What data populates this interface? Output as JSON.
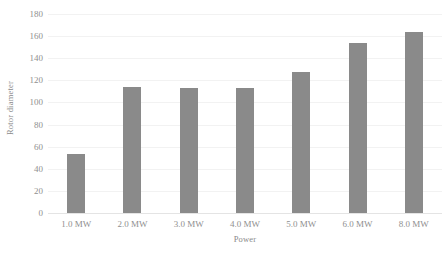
{
  "chart_data": {
    "type": "bar",
    "title": "",
    "xlabel": "Power",
    "ylabel": "Rotor diameter",
    "categories": [
      "1.0 MW",
      "2.0 MW",
      "3.0 MW",
      "4.0 MW",
      "5.0 MW",
      "6.0 MW",
      "8.0 MW"
    ],
    "values": [
      53,
      114,
      113,
      113,
      128,
      154,
      164
    ],
    "series": [
      {
        "name": "Rotor diameter",
        "values": [
          53,
          114,
          113,
          113,
          128,
          154,
          164
        ]
      }
    ],
    "ylim": [
      0,
      180
    ],
    "yticks": [
      0,
      20,
      40,
      60,
      80,
      100,
      120,
      140,
      160,
      180
    ],
    "ytick_labels": [
      "0",
      "20",
      "40",
      "60",
      "80",
      "100",
      "120",
      "140",
      "160",
      "180"
    ],
    "grid": true,
    "grid_axis": "y",
    "legend": false,
    "legend_position": "none",
    "bar_color": "#8a8a8a",
    "gridline_color": "#f2f2f2",
    "axis_line_color": "#e4e4e4",
    "text_color": "#8f8f8f",
    "background_color": "#ffffff"
  }
}
